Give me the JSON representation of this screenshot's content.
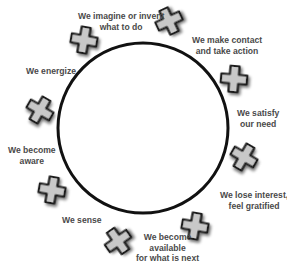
{
  "diagram": {
    "type": "cycle",
    "shape": "circle",
    "circle": {
      "cx": 143,
      "cy": 128,
      "r": 85,
      "stroke": "#111111",
      "stroke_width": 3
    },
    "cross_style": {
      "fill": "#c8c8c8",
      "stroke": "#1a1a1a",
      "shadow": "#9a9a9a"
    },
    "stages": [
      {
        "id": "imagine",
        "lines": [
          "We imagine or invent",
          "what to do"
        ],
        "label_pos": {
          "x": 78,
          "y": 11,
          "align": "center"
        }
      },
      {
        "id": "contact",
        "lines": [
          "We make contact",
          "and take action"
        ],
        "label_pos": {
          "x": 192,
          "y": 35,
          "align": "center"
        }
      },
      {
        "id": "satisfy",
        "lines": [
          "We satisfy",
          "our need"
        ],
        "label_pos": {
          "x": 237,
          "y": 108,
          "align": "center"
        }
      },
      {
        "id": "lose-interest",
        "lines": [
          "We lose interest,",
          "feel gratified"
        ],
        "label_pos": {
          "x": 220,
          "y": 190,
          "align": "center"
        }
      },
      {
        "id": "available",
        "lines": [
          "We become",
          "available",
          "for what is next"
        ],
        "label_pos": {
          "x": 136,
          "y": 232,
          "align": "center"
        }
      },
      {
        "id": "sense",
        "lines": [
          "We sense"
        ],
        "label_pos": {
          "x": 62,
          "y": 215,
          "align": "left"
        }
      },
      {
        "id": "aware",
        "lines": [
          "We become",
          "aware"
        ],
        "label_pos": {
          "x": 8,
          "y": 145,
          "align": "center"
        }
      },
      {
        "id": "energize",
        "lines": [
          "We energize"
        ],
        "label_pos": {
          "x": 26,
          "y": 66,
          "align": "left"
        }
      }
    ],
    "crosses": [
      {
        "id": "cross-1",
        "cx": 84,
        "cy": 40,
        "rotate": 10
      },
      {
        "id": "cross-2",
        "cx": 169,
        "cy": 21,
        "rotate": -25
      },
      {
        "id": "cross-3",
        "cx": 234,
        "cy": 79,
        "rotate": 5
      },
      {
        "id": "cross-4",
        "cx": 244,
        "cy": 157,
        "rotate": 30
      },
      {
        "id": "cross-5",
        "cx": 195,
        "cy": 226,
        "rotate": 10
      },
      {
        "id": "cross-6",
        "cx": 118,
        "cy": 241,
        "rotate": -35
      },
      {
        "id": "cross-7",
        "cx": 52,
        "cy": 190,
        "rotate": 10
      },
      {
        "id": "cross-8",
        "cx": 40,
        "cy": 110,
        "rotate": 30
      }
    ]
  }
}
